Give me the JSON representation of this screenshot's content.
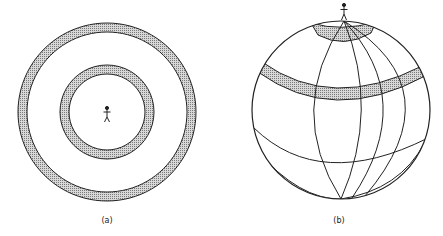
{
  "figure": {
    "panels": [
      {
        "id": "a",
        "label": "(a)",
        "description": "Top view: observer at center surrounded by two concentric shaded rings",
        "rings": [
          {
            "name": "inner-ring",
            "outer_radius": 47,
            "inner_radius": 38
          },
          {
            "name": "outer-ring",
            "outer_radius": 89,
            "inner_radius": 80
          }
        ]
      },
      {
        "id": "b",
        "label": "(b)",
        "description": "Globe view: observer standing at north pole with shaded latitude bands"
      }
    ],
    "colors": {
      "stroke": "#222222",
      "band_fill": "#bdbdbd",
      "background": "#ffffff"
    }
  }
}
